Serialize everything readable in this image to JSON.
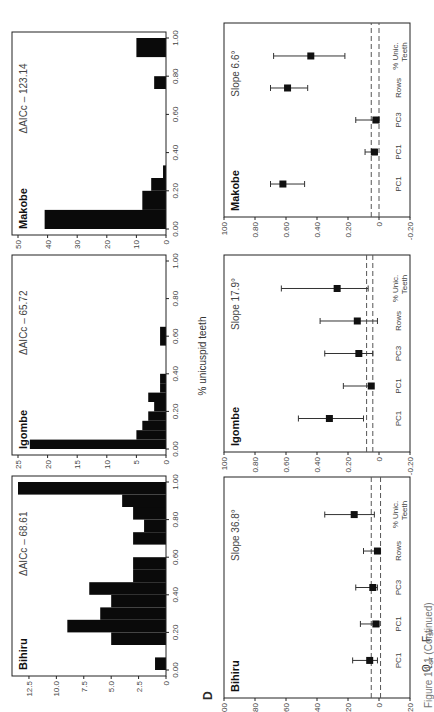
{
  "figure": {
    "panel_letter": "D",
    "shared_xlabel": "% unicuspid teeth",
    "caption_partial": "Figure 14.1 (Continued)",
    "orientation": "rotated 90 degrees clockwise"
  },
  "chart_data": [
    {
      "type": "bar",
      "title": "Bihiru",
      "annotation": "ΔAICc – 68.61",
      "xlabel": "% unicuspid teeth",
      "ylabel": "",
      "xlim": [
        0,
        1.0
      ],
      "ylim": [
        0,
        13.5
      ],
      "xticks": [
        "0.00",
        "0.20",
        "0.40",
        "0.60",
        "0.80",
        "1.00"
      ],
      "yticks": [
        "0",
        "2.5",
        "5.0",
        "7.5",
        "10.0",
        "12.5"
      ],
      "bin_edges": [
        0.0,
        0.067,
        0.133,
        0.2,
        0.267,
        0.333,
        0.4,
        0.467,
        0.533,
        0.6,
        0.667,
        0.733,
        0.8,
        0.867,
        0.933,
        1.0
      ],
      "values": [
        1,
        0,
        5,
        9,
        6,
        5,
        7,
        3,
        3,
        0,
        3,
        2,
        3,
        4,
        13.5
      ]
    },
    {
      "type": "bar",
      "title": "Igombe",
      "annotation": "ΔAICc – 65.72",
      "xlabel": "% unicuspid teeth",
      "ylabel": "",
      "xlim": [
        0,
        1.0
      ],
      "ylim": [
        0,
        25
      ],
      "xticks": [
        "0.00",
        "0.20",
        "0.40",
        "0.60",
        "0.80",
        "1.00"
      ],
      "yticks": [
        "0",
        "5",
        "10",
        "15",
        "20",
        "25"
      ],
      "bin_edges": [
        0.0,
        0.05,
        0.1,
        0.15,
        0.2,
        0.25,
        0.3,
        0.35,
        0.4,
        0.55,
        0.65
      ],
      "values": [
        23,
        5,
        4,
        3,
        2,
        3,
        1,
        1,
        0,
        1
      ]
    },
    {
      "type": "bar",
      "title": "Makobe",
      "annotation": "ΔAICc – 123.14",
      "xlabel": "% unicuspid teeth",
      "ylabel": "",
      "xlim": [
        0,
        1.0
      ],
      "ylim": [
        0,
        50
      ],
      "xticks": [
        "0.00",
        "0.20",
        "0.40",
        "0.60",
        "0.80",
        "1.00"
      ],
      "yticks": [
        "0",
        "10",
        "20",
        "30",
        "40",
        "50"
      ],
      "bin_edges": [
        0.0,
        0.1,
        0.2,
        0.267,
        0.333,
        0.6,
        0.733,
        0.8,
        0.9,
        1.0
      ],
      "values": [
        41,
        8,
        5,
        1,
        0,
        0,
        4,
        0,
        10
      ]
    },
    {
      "type": "scatter",
      "title": "Bihiru",
      "annotation": "Slope 36.8°",
      "ylabel_top": "Q_ST",
      "ylabel_bottom": "F_ST",
      "ylim": [
        -0.2,
        1.0
      ],
      "yticks": [
        "-0.20",
        "0",
        "0.20",
        "0.40",
        "0.60",
        "0.80",
        "1.00"
      ],
      "categories": [
        "PC1",
        "PC1",
        "PC3",
        "Rows",
        "% Unic. Teeth"
      ],
      "values": [
        0.06,
        0.02,
        0.04,
        0.01,
        0.16
      ],
      "ci_low": [
        0.01,
        0.0,
        0.01,
        0.0,
        0.03
      ],
      "ci_high": [
        0.17,
        0.12,
        0.15,
        0.1,
        0.35
      ],
      "dashed_lines": [
        0.05,
        -0.01
      ]
    },
    {
      "type": "scatter",
      "title": "Igombe",
      "annotation": "Slope 17.9°",
      "ylim": [
        -0.2,
        1.0
      ],
      "yticks": [
        "-0.20",
        "0",
        "0.20",
        "0.40",
        "0.60",
        "0.80",
        "1.00"
      ],
      "categories": [
        "PC1",
        "PC1",
        "PC3",
        "Rows",
        "% Unic. Teeth"
      ],
      "values": [
        0.32,
        0.05,
        0.13,
        0.14,
        0.27
      ],
      "ci_low": [
        0.1,
        0.04,
        0.04,
        0.01,
        0.07
      ],
      "ci_high": [
        0.52,
        0.23,
        0.35,
        0.38,
        0.63
      ],
      "dashed_lines": [
        0.08,
        0.04
      ]
    },
    {
      "type": "scatter",
      "title": "Makobe",
      "annotation": "Slope 6.6°",
      "ylim": [
        -0.2,
        1.0
      ],
      "yticks": [
        "-0.20",
        "0",
        "0.20",
        "0.40",
        "0.60",
        "0.80",
        "1.00"
      ],
      "categories": [
        "PC1",
        "PC1",
        "PC3",
        "Rows",
        "% Unic. Teeth"
      ],
      "values": [
        0.62,
        0.03,
        0.02,
        0.59,
        0.44
      ],
      "ci_low": [
        0.48,
        0.01,
        0.0,
        0.46,
        0.22
      ],
      "ci_high": [
        0.7,
        0.09,
        0.15,
        0.7,
        0.68
      ],
      "dashed_lines": [
        0.05,
        0.0
      ]
    }
  ]
}
